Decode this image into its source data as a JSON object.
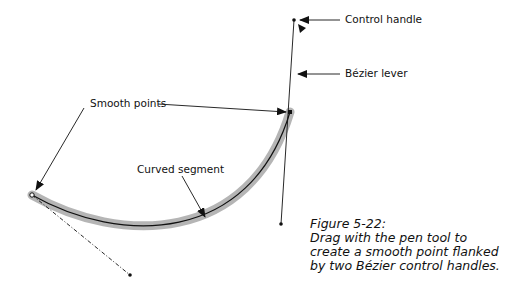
{
  "labels": {
    "control_handle": "Control handle",
    "bezier_lever": "Bézier lever",
    "smooth_points": "Smooth points",
    "curved_segment": "Curved segment"
  },
  "caption": {
    "title": "Figure 5-22:",
    "lines": [
      "Drag with the pen tool to",
      "create a smooth point flanked",
      "by two Bézier control handles."
    ]
  },
  "colors": {
    "stroke": "#111111",
    "highlight": "#a8a8a8",
    "background": "#ffffff"
  }
}
